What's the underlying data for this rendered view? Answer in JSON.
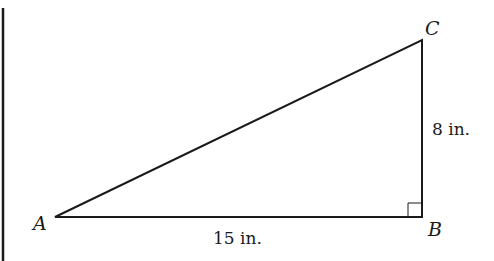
{
  "diagram": {
    "type": "right-triangle",
    "vertices": [
      {
        "label": "A",
        "x": 55,
        "y": 217
      },
      {
        "label": "B",
        "x": 422,
        "y": 217
      },
      {
        "label": "C",
        "x": 422,
        "y": 40
      }
    ],
    "sides": [
      {
        "between": "AB",
        "label": "15 in."
      },
      {
        "between": "BC",
        "label": "8 in."
      }
    ],
    "right_angle_at": "B",
    "stroke_color": "#1a1a1a"
  }
}
